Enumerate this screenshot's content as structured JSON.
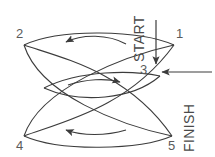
{
  "diagram": {
    "background_color": "#ffffff",
    "stroke_color": "#3c3c3c",
    "label_color": "#5a5a5a",
    "nodes": [
      {
        "id": "1",
        "label": "1",
        "position": "top-right",
        "x": 176,
        "y": 38
      },
      {
        "id": "2",
        "label": "2",
        "position": "top-left",
        "x": 16,
        "y": 38
      },
      {
        "id": "3",
        "label": "3",
        "position": "center-right",
        "x": 140,
        "y": 74
      },
      {
        "id": "4",
        "label": "4",
        "position": "bottom-left",
        "x": 16,
        "y": 143
      },
      {
        "id": "5",
        "label": "5",
        "position": "bottom-right",
        "x": 170,
        "y": 143
      }
    ],
    "markers": [
      {
        "id": "start",
        "label": "START",
        "orientation": "vertical-rotated",
        "arrow_direction": "down",
        "arrow_from": {
          "x": 156,
          "y": 22
        },
        "arrow_to": {
          "x": 156,
          "y": 66
        }
      },
      {
        "id": "finish",
        "label": "FINISH",
        "orientation": "vertical-rotated",
        "arrow_direction": "left",
        "arrow_from": {
          "x": 211,
          "y": 72
        },
        "arrow_to": {
          "x": 161,
          "y": 72
        }
      }
    ],
    "flow_arrows": [
      {
        "id": "top-flow",
        "direction": "left",
        "region": "top",
        "curvature": "arc-up"
      },
      {
        "id": "middle-flow",
        "direction": "right",
        "region": "middle",
        "curvature": "arc-up"
      },
      {
        "id": "bottom-flow",
        "direction": "left",
        "region": "bottom",
        "curvature": "arc-down"
      }
    ],
    "curves": [
      {
        "id": "curve-2-to-5",
        "from": "2",
        "to": "5",
        "shape": "upper-lens-arc"
      },
      {
        "id": "curve-4-to-1",
        "from": "4",
        "to": "1",
        "shape": "lower-lens-arc"
      },
      {
        "id": "curve-2-to-5b",
        "from": "2",
        "to": "5",
        "shape": "inner-arc"
      },
      {
        "id": "curve-4-to-1b",
        "from": "4",
        "to": "1",
        "shape": "inner-arc"
      }
    ]
  }
}
